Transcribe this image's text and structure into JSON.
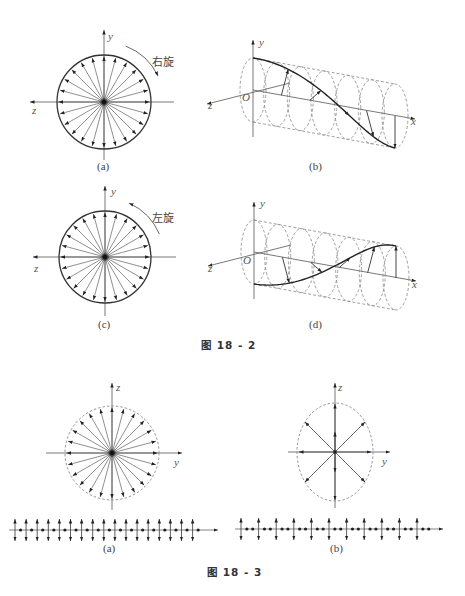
{
  "figure_18_2": {
    "caption": "图 18 - 2",
    "panels": {
      "a": {
        "label": "(a)",
        "rotation_label": "右旋",
        "axis_vertical": "y",
        "axis_horizontal": "z",
        "rays": 24,
        "boundary": "solid"
      },
      "b": {
        "label": "(b)",
        "axis_vertical": "y",
        "axis_depth": "z",
        "axis_long": "x",
        "origin": "O",
        "helix": "right-handed"
      },
      "c": {
        "label": "(c)",
        "rotation_label": "左旋",
        "axis_vertical": "y",
        "axis_horizontal": "z",
        "rays": 24,
        "boundary": "solid"
      },
      "d": {
        "label": "(d)",
        "axis_vertical": "y",
        "axis_depth": "z",
        "axis_long": "x",
        "origin": "O",
        "helix": "left-handed"
      }
    }
  },
  "figure_18_3": {
    "caption": "图 18 - 3",
    "panels": {
      "a": {
        "label": "(a)",
        "axis_vertical": "z",
        "axis_horizontal": "y",
        "rays": 24,
        "boundary": "dashed-circle",
        "wave_arrows": 17,
        "dots_between": 1
      },
      "b": {
        "label": "(b)",
        "axis_vertical": "z",
        "axis_horizontal": "y",
        "rays": 8,
        "boundary": "dashed-ellipse",
        "wave_arrows": 11,
        "dots_between": 2
      }
    }
  },
  "colors": {
    "line": "#333333",
    "dashed": "#888888",
    "background": "#ffffff"
  }
}
